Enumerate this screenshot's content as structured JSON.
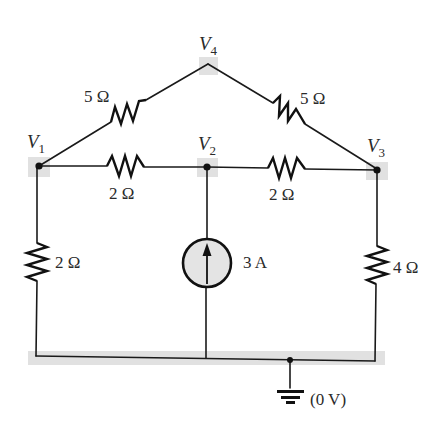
{
  "diagram": {
    "type": "circuit-schematic",
    "nodes": [
      {
        "id": "V1",
        "label": "V",
        "subscript": "1"
      },
      {
        "id": "V2",
        "label": "V",
        "subscript": "2"
      },
      {
        "id": "V3",
        "label": "V",
        "subscript": "3"
      },
      {
        "id": "V4",
        "label": "V",
        "subscript": "4"
      }
    ],
    "components": {
      "r_v1_v4": {
        "label": "5 Ω",
        "between": [
          "V1",
          "V4"
        ]
      },
      "r_v4_v3": {
        "label": "5 Ω",
        "between": [
          "V4",
          "V3"
        ]
      },
      "r_v1_v2": {
        "label": "2 Ω",
        "between": [
          "V1",
          "V2"
        ]
      },
      "r_v2_v3": {
        "label": "2 Ω",
        "between": [
          "V2",
          "V3"
        ]
      },
      "r_v1_gnd": {
        "label": "2 Ω",
        "between": [
          "V1",
          "ground"
        ]
      },
      "r_v3_gnd": {
        "label": "4 Ω",
        "between": [
          "V3",
          "ground"
        ]
      },
      "i_source": {
        "label": "3 A",
        "between": [
          "ground",
          "V2"
        ],
        "direction": "up"
      }
    },
    "ground": {
      "label": "(0 V)"
    },
    "colors": {
      "wire": "#1a1a1a",
      "node_highlight": "#dcdcdc",
      "source_fill": "#e4e4e4",
      "background": "#ffffff"
    }
  }
}
